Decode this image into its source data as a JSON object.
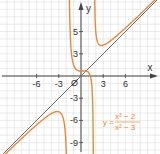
{
  "chart_data": {
    "type": "line",
    "title": "",
    "xlabel": "x",
    "ylabel": "y",
    "xlim": [
      -10,
      10
    ],
    "ylim": [
      -10,
      10
    ],
    "grid": true,
    "x_ticks": [
      "-6",
      "-3",
      "Ø",
      "3",
      "6"
    ],
    "y_ticks": [
      "5",
      "3",
      "-3",
      "-6",
      "-9"
    ],
    "origin_label": "Ø",
    "annotation": {
      "text_lhs": "y =",
      "numerator": "x³ − 2",
      "denominator": "x² − 3"
    },
    "series": [
      {
        "name": "y = (x³ − 2)/(x² − 3)",
        "color": "#e8893a",
        "description": "rational function with vertical asymptotes at x = −√3 and x = √3"
      },
      {
        "name": "y = x",
        "color": "#707070",
        "description": "oblique asymptote"
      }
    ]
  },
  "colors": {
    "curve": "#e8893a",
    "asymptote": "#707070",
    "grid": "#dcdcdc",
    "axis": "#444444"
  }
}
